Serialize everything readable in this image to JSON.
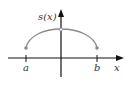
{
  "figure": {
    "function_label": "s(x)",
    "x_axis_label": "x",
    "points": {
      "left": "a",
      "right": "b"
    },
    "colors": {
      "axis": "#111111",
      "curve": "#8a8a8a",
      "endpoint": "#8a8a8a"
    }
  }
}
